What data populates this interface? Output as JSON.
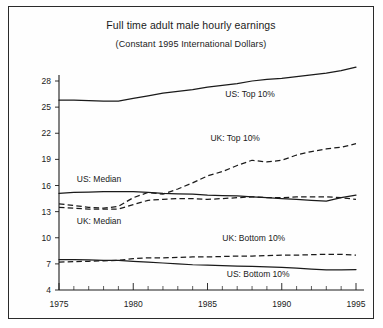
{
  "chart_data": {
    "type": "line",
    "title": "Full time adult male hourly earnings",
    "subtitle": "(Constant 1995 International Dollars)",
    "xlabel": "",
    "ylabel": "",
    "xlim": [
      1975,
      1995
    ],
    "ylim": [
      4,
      28
    ],
    "yticks": [
      4,
      7,
      10,
      13,
      16,
      19,
      22,
      25,
      28
    ],
    "xticks": [
      1975,
      1980,
      1985,
      1990,
      1995
    ],
    "xtick_labels": [
      "1975",
      "1980",
      "1985",
      "1990",
      "1995"
    ],
    "ytick_labels": [
      "4",
      "7",
      "10",
      "13",
      "16",
      "19",
      "22",
      "25",
      "28"
    ],
    "grid": false,
    "legend": "inline-labels",
    "x": [
      1975,
      1976,
      1977,
      1978,
      1979,
      1980,
      1981,
      1982,
      1983,
      1984,
      1985,
      1986,
      1987,
      1988,
      1989,
      1990,
      1991,
      1992,
      1993,
      1994,
      1995
    ],
    "series": [
      {
        "name": "US: Top 10%",
        "style": "solid",
        "label": "US: Top 10%",
        "label_x": 1986.2,
        "label_y": 26.2,
        "values": [
          25.8,
          25.8,
          25.75,
          25.7,
          25.7,
          26.0,
          26.3,
          26.6,
          26.8,
          27.0,
          27.3,
          27.5,
          27.7,
          28.0,
          28.2,
          28.3,
          28.5,
          28.7,
          28.9,
          29.2,
          29.6
        ]
      },
      {
        "name": "UK: Top 10%",
        "style": "dashed",
        "label": "UK: Top 10%",
        "label_x": 1985.2,
        "label_y": 21.1,
        "values": [
          13.9,
          13.7,
          13.5,
          13.4,
          13.6,
          14.6,
          15.2,
          15.0,
          15.6,
          16.3,
          17.1,
          17.6,
          18.3,
          18.9,
          18.7,
          18.9,
          19.5,
          19.9,
          20.2,
          20.4,
          20.8
        ]
      },
      {
        "name": "US: Median",
        "style": "solid",
        "label": "US: Median",
        "label_x": 1976.2,
        "label_y": 16.4,
        "values": [
          15.1,
          15.2,
          15.25,
          15.3,
          15.3,
          15.3,
          15.2,
          15.1,
          15.05,
          15.0,
          14.9,
          14.85,
          14.8,
          14.7,
          14.6,
          14.5,
          14.4,
          14.3,
          14.2,
          14.6,
          14.9
        ]
      },
      {
        "name": "UK: Median",
        "style": "dashed",
        "label": "UK: Median",
        "label_x": 1976.2,
        "label_y": 11.6,
        "values": [
          13.5,
          13.4,
          13.3,
          13.3,
          13.3,
          13.8,
          14.3,
          14.4,
          14.5,
          14.5,
          14.4,
          14.5,
          14.6,
          14.7,
          14.6,
          14.6,
          14.7,
          14.7,
          14.7,
          14.6,
          14.4
        ]
      },
      {
        "name": "UK: Bottom 10%",
        "style": "dashed",
        "label": "UK: Bottom 10%",
        "label_x": 1986.0,
        "label_y": 9.6,
        "values": [
          7.2,
          7.25,
          7.3,
          7.35,
          7.4,
          7.6,
          7.7,
          7.7,
          7.75,
          7.8,
          7.8,
          7.85,
          7.9,
          7.9,
          7.95,
          8.0,
          8.0,
          8.05,
          8.1,
          8.1,
          8.0
        ]
      },
      {
        "name": "US: Bottom 10%",
        "style": "solid",
        "label": "US: Bottom 10%",
        "label_x": 1986.3,
        "label_y": 5.5,
        "values": [
          7.5,
          7.5,
          7.45,
          7.4,
          7.4,
          7.3,
          7.2,
          7.1,
          7.0,
          6.9,
          6.85,
          6.8,
          6.75,
          6.7,
          6.65,
          6.6,
          6.5,
          6.4,
          6.3,
          6.3,
          6.35
        ]
      }
    ]
  }
}
